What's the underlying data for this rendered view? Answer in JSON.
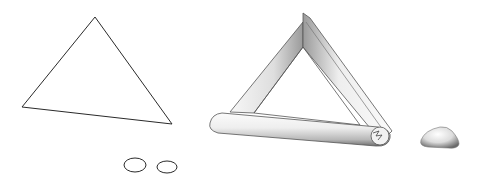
{
  "figure": {
    "colors": {
      "background": "#ffffff",
      "line": "#2a2a2a",
      "shade_light": "#f4f4f4",
      "shade_mid": "#c9c9c9",
      "shade_dark": "#7a7a7a"
    },
    "elements": [
      {
        "id": "path-triangle",
        "kind": "2d-outline",
        "points": [
          [
            95,
            17
          ],
          [
            22,
            107
          ],
          [
            172,
            124
          ]
        ]
      },
      {
        "id": "profile-ellipse-1",
        "kind": "ellipse",
        "cx": 135,
        "cy": 165,
        "rx": 11,
        "ry": 7
      },
      {
        "id": "profile-ellipse-2",
        "kind": "ellipse",
        "cx": 167,
        "cy": 167,
        "rx": 10,
        "ry": 6
      },
      {
        "id": "swept-triangle",
        "kind": "3d-tube",
        "points": [
          [
            303,
            13
          ],
          [
            213,
            120
          ],
          [
            390,
            140
          ]
        ]
      },
      {
        "id": "rounded-solid",
        "kind": "3d-blob",
        "bbox": [
          420,
          127,
          459,
          148
        ]
      }
    ]
  }
}
